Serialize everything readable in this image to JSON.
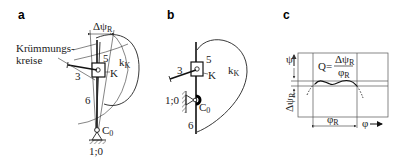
{
  "figure": {
    "panels": [
      {
        "id": "a",
        "label": "a",
        "annotations": {
          "delta_psi": "Δψ",
          "delta_psi_sub": "R",
          "kruemmung_line1": "Krümmungs-",
          "kruemmung_line2": "kreise",
          "link5": "5",
          "curve": "k",
          "curve_sub": "K",
          "point_k": "K",
          "link3": "3",
          "link6": "6",
          "pivot": "C",
          "pivot_sub": "0",
          "ground": "1;0"
        }
      },
      {
        "id": "b",
        "label": "b",
        "annotations": {
          "link5": "5",
          "link3": "3",
          "point_k": "K",
          "curve": "k",
          "curve_sub": "K",
          "ground": "1;0",
          "pivot": "C",
          "pivot_sub": "0",
          "link6": "6"
        }
      },
      {
        "id": "c",
        "label": "c",
        "annotations": {
          "y_axis": "ψ",
          "x_axis": "φ",
          "formula_lhs": "Q=",
          "formula_num": "Δψ",
          "formula_num_sub": "R",
          "formula_den": "φ",
          "formula_den_sub": "R",
          "delta_psi_axis": "Δψ",
          "delta_psi_axis_sub": "R",
          "phi_r": "φ",
          "phi_r_sub": "R"
        }
      }
    ]
  }
}
